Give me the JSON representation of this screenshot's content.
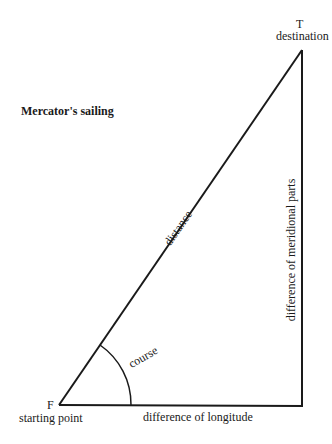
{
  "title": "Mercator's sailing",
  "points": {
    "start": {
      "letter": "F",
      "label": "starting point"
    },
    "end": {
      "letter": "T",
      "label": "destination"
    }
  },
  "edges": {
    "hypotenuse": "distance",
    "base": "difference of longitude",
    "vertical": "difference of meridional parts"
  },
  "angle": {
    "label": "course"
  },
  "colors": {
    "line": "#1a1a1a",
    "background": "#ffffff"
  }
}
